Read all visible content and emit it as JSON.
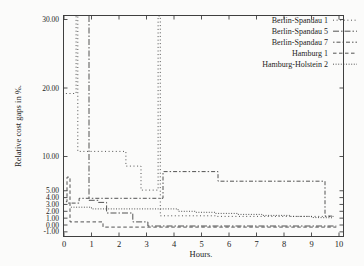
{
  "chart_data": {
    "type": "line",
    "step": true,
    "title": "",
    "xlabel": "Hours.",
    "ylabel": "Relative cost gaps in %.",
    "xlim": [
      0,
      10.15
    ],
    "ylim": [
      -1.6,
      30.5
    ],
    "grid": false,
    "legend_position": "top-right-inside",
    "x_ticks": [
      0,
      1,
      2,
      3,
      4,
      5,
      6,
      7,
      8,
      9,
      10
    ],
    "y_ticks": [
      {
        "v": 30,
        "label": "30.00"
      },
      {
        "v": 20,
        "label": "20.00"
      },
      {
        "v": 10,
        "label": "10.00"
      },
      {
        "v": 5,
        "label": "5.00"
      },
      {
        "v": 4,
        "label": "4.00"
      },
      {
        "v": 3,
        "label": "3.00"
      },
      {
        "v": 2,
        "label": "2.00"
      },
      {
        "v": 1,
        "label": "1.00"
      },
      {
        "v": 0,
        "label": "0.00"
      },
      {
        "v": -1,
        "label": "-1.00"
      }
    ],
    "line_color": "#3f3f3f",
    "series": [
      {
        "name": "Berlin-Spandau 1",
        "dash": "dotted",
        "points": [
          [
            0.07,
            19.2
          ],
          [
            0.44,
            19.2
          ],
          [
            0.44,
            32
          ],
          [
            0.5,
            32
          ],
          [
            0.5,
            10.75
          ],
          [
            2.25,
            10.75
          ],
          [
            2.25,
            8.6
          ],
          [
            2.8,
            8.6
          ],
          [
            2.8,
            5.1
          ],
          [
            3.42,
            5.1
          ],
          [
            3.42,
            32
          ],
          [
            3.5,
            32
          ],
          [
            3.5,
            1.35
          ],
          [
            5.5,
            1.35
          ],
          [
            5.5,
            1.25
          ],
          [
            9.8,
            1.25
          ]
        ]
      },
      {
        "name": "Berlin-Spandau 5",
        "dash": "dash-dot",
        "points": [
          [
            0.91,
            32
          ],
          [
            0.91,
            3.6
          ],
          [
            1.25,
            3.6
          ],
          [
            1.25,
            3.3
          ],
          [
            1.55,
            3.3
          ],
          [
            1.55,
            1.75
          ],
          [
            2.5,
            1.75
          ],
          [
            2.5,
            0.45
          ],
          [
            3.05,
            0.45
          ],
          [
            3.05,
            -0.15
          ],
          [
            9.9,
            -0.15
          ]
        ]
      },
      {
        "name": "Berlin-Spandau 7",
        "dash": "dash-dot-short",
        "points": [
          [
            0.15,
            3.2
          ],
          [
            0.55,
            3.2
          ],
          [
            0.55,
            3.9
          ],
          [
            3.6,
            3.9
          ],
          [
            3.6,
            7.8
          ],
          [
            5.6,
            7.8
          ],
          [
            5.6,
            6.4
          ],
          [
            9.49,
            6.4
          ],
          [
            9.49,
            1.3
          ],
          [
            9.8,
            1.3
          ]
        ]
      },
      {
        "name": "Hamburg 1",
        "dash": "dashed",
        "points": [
          [
            0.07,
            3.4
          ],
          [
            0.11,
            3.4
          ],
          [
            0.11,
            7.0
          ],
          [
            0.22,
            7.0
          ],
          [
            0.22,
            0.45
          ],
          [
            1.42,
            0.45
          ],
          [
            1.42,
            -0.3
          ],
          [
            9.9,
            -0.3
          ]
        ]
      },
      {
        "name": "Hamburg-Holstein 2",
        "dash": "dense-dotted",
        "points": [
          [
            0.25,
            2.6
          ],
          [
            1.0,
            2.6
          ],
          [
            1.0,
            2.35
          ],
          [
            4.15,
            2.35
          ],
          [
            4.15,
            2.0
          ],
          [
            4.8,
            2.0
          ],
          [
            4.8,
            1.85
          ],
          [
            5.5,
            1.85
          ],
          [
            5.5,
            1.7
          ],
          [
            6.3,
            1.7
          ],
          [
            6.3,
            1.55
          ],
          [
            7.2,
            1.55
          ],
          [
            7.2,
            1.4
          ],
          [
            8.2,
            1.4
          ],
          [
            8.2,
            1.25
          ],
          [
            9.0,
            1.25
          ],
          [
            9.0,
            1.1
          ],
          [
            9.8,
            1.05
          ]
        ]
      }
    ]
  }
}
